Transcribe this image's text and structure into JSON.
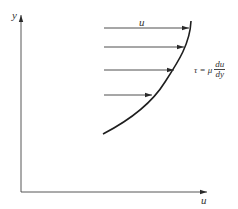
{
  "diagram": {
    "axes": {
      "y_label": "y",
      "x_label": "u"
    },
    "velocity_label": "u",
    "formula": {
      "lhs": "τ = μ",
      "numerator": "du",
      "denominator": "dy"
    },
    "colors": {
      "line": "#2a2a2a",
      "text": "#333333",
      "background": "#ffffff"
    },
    "arrows": [
      {
        "y": 28,
        "x_start": 104,
        "x_end": 189
      },
      {
        "y": 47,
        "x_start": 104,
        "x_end": 184
      },
      {
        "y": 70,
        "x_start": 104,
        "x_end": 174
      },
      {
        "y": 95,
        "x_start": 104,
        "x_end": 152
      }
    ]
  }
}
